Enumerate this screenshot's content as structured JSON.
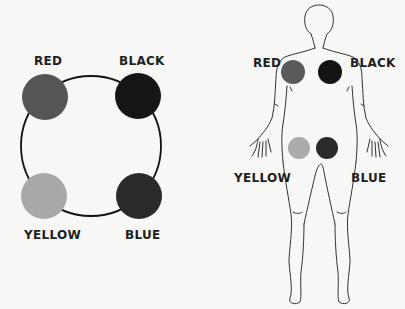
{
  "left_diagram": {
    "labels": {
      "red": "RED",
      "black": "BLACK",
      "yellow": "YELLOW",
      "blue": "BLUE"
    },
    "colors": {
      "red": "#555555",
      "black": "#151515",
      "yellow": "#a9a9a9",
      "blue": "#2a2a2a",
      "ring": "#111111"
    }
  },
  "body_diagram": {
    "labels": {
      "red": "RED",
      "black": "BLACK",
      "yellow": "YELLOW",
      "blue": "BLUE"
    },
    "colors": {
      "red": "#5a5a5a",
      "black": "#141414",
      "yellow": "#ababab",
      "blue": "#2b2b2b",
      "outline": "#333333"
    }
  }
}
